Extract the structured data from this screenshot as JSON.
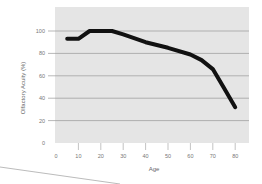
{
  "chart_data": {
    "type": "line",
    "title": "",
    "xlabel": "Age",
    "ylabel": "Olfactory Acuity (%)",
    "xlim": [
      0,
      85
    ],
    "ylim": [
      0,
      110
    ],
    "xticks": [
      0,
      10,
      20,
      30,
      40,
      50,
      60,
      70,
      80
    ],
    "yticks": [
      0,
      20,
      40,
      60,
      80,
      100
    ],
    "grid": "horizontal",
    "legend": null,
    "series": [
      {
        "name": "Olfactory Acuity",
        "x": [
          5,
          10,
          15,
          20,
          25,
          30,
          40,
          50,
          60,
          65,
          70,
          75,
          80
        ],
        "y": [
          93,
          93,
          100,
          100,
          100,
          97,
          90,
          85,
          79,
          74,
          66,
          49,
          32
        ]
      }
    ]
  },
  "colors": {
    "plot_background": "#e5e5e5",
    "gridline": "#9a9a9a",
    "line": "#111111",
    "text": "#777777"
  }
}
